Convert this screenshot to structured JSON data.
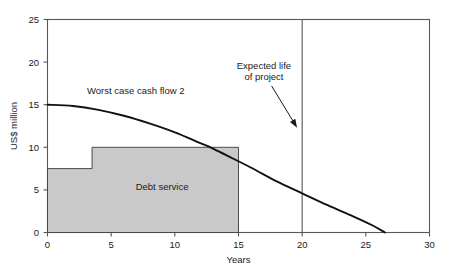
{
  "chart_data": {
    "type": "area",
    "title": "",
    "subtitle": "",
    "xlabel": "Years",
    "ylabel": "US$ million",
    "xlim": [
      0,
      30
    ],
    "ylim": [
      0,
      25
    ],
    "xticks": [
      0,
      5,
      10,
      15,
      20,
      25,
      30
    ],
    "yticks": [
      0,
      5,
      10,
      15,
      20,
      25
    ],
    "xtick_labels": [
      "0",
      "5",
      "10",
      "15",
      "20",
      "25",
      "30"
    ],
    "ytick_labels": [
      "0",
      "5",
      "10",
      "15",
      "20",
      "25"
    ],
    "grid": false,
    "legend": "none",
    "frame": "box",
    "series": [
      {
        "name": "Debt service",
        "type": "step-area",
        "label": "Debt service",
        "label_x": 9.0,
        "label_y": 5.0,
        "fill_color": "#c9c9c9",
        "edge_color": "#4a4a4a",
        "steps": [
          {
            "x_start": 0.0,
            "x_end": 3.5,
            "value": 7.5
          },
          {
            "x_start": 3.5,
            "x_end": 15.0,
            "value": 10.0
          }
        ]
      },
      {
        "name": "Worst case cash flow 2",
        "type": "line",
        "label": "Worst case cash flow 2",
        "label_x": 3.1,
        "label_y": 16.2,
        "color": "#111111",
        "points": [
          {
            "x": 0.0,
            "y": 15.0
          },
          {
            "x": 2.0,
            "y": 14.85
          },
          {
            "x": 4.0,
            "y": 14.4
          },
          {
            "x": 6.0,
            "y": 13.7
          },
          {
            "x": 8.0,
            "y": 12.8
          },
          {
            "x": 10.0,
            "y": 11.75
          },
          {
            "x": 12.0,
            "y": 10.5
          },
          {
            "x": 12.8,
            "y": 10.0
          },
          {
            "x": 14.0,
            "y": 9.1
          },
          {
            "x": 16.0,
            "y": 7.6
          },
          {
            "x": 18.0,
            "y": 6.0
          },
          {
            "x": 20.0,
            "y": 4.6
          },
          {
            "x": 22.0,
            "y": 3.2
          },
          {
            "x": 24.0,
            "y": 1.9
          },
          {
            "x": 25.5,
            "y": 0.85
          },
          {
            "x": 26.5,
            "y": 0.0
          }
        ]
      }
    ],
    "markers": [
      {
        "name": "expected-life-line",
        "type": "vline",
        "x": 20,
        "y_from": 0,
        "y_to": 25,
        "color": "#575757"
      }
    ],
    "annotations": [
      {
        "name": "expected-life-annotation",
        "lines": [
          "Expected life",
          "of project"
        ],
        "text_x": 17.0,
        "text_y": 19.2,
        "arrow_from": {
          "x": 17.6,
          "y": 17.2
        },
        "arrow_to": {
          "x": 19.6,
          "y": 12.3
        }
      }
    ]
  },
  "axes": {
    "x_label": "Years",
    "y_label": "US$ million"
  }
}
